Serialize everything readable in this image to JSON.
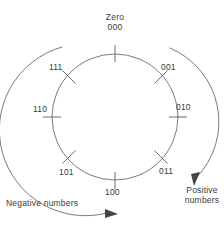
{
  "figure": {
    "type": "diagram",
    "colors": {
      "line": "#6b6b6b",
      "text": "#3a3a3a",
      "arrow": "#444444",
      "background": "#ffffff"
    },
    "circle": {
      "center_x": 115,
      "center_y": 117,
      "radius": 63
    },
    "labels": {
      "zero_word": "Zero",
      "zero_code": "000",
      "code_001": "001",
      "code_010": "010",
      "code_011": "011",
      "code_100": "100",
      "code_101": "101",
      "code_110": "110",
      "code_111": "111",
      "negative_direction": "Negative numbers",
      "positive_direction_line1": "Positive",
      "positive_direction_line2": "numbers"
    },
    "ticks": [
      {
        "code": "000",
        "angle_deg": 90
      },
      {
        "code": "001",
        "angle_deg": 45
      },
      {
        "code": "010",
        "angle_deg": 0
      },
      {
        "code": "011",
        "angle_deg": -45
      },
      {
        "code": "100",
        "angle_deg": -90
      },
      {
        "code": "101",
        "angle_deg": -135
      },
      {
        "code": "110",
        "angle_deg": 180
      },
      {
        "code": "111",
        "angle_deg": 135
      }
    ],
    "arrows": {
      "negative": {
        "direction": "clockwise-from-top-left-to-bottom",
        "side": "left"
      },
      "positive": {
        "direction": "clockwise-from-top-right-to-bottom",
        "side": "right"
      }
    }
  }
}
